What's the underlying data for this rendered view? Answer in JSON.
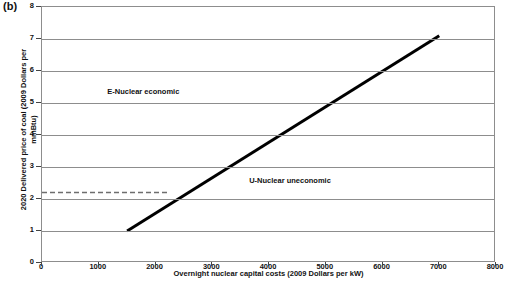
{
  "panel": {
    "label": "(b)"
  },
  "chart_data": {
    "type": "line",
    "title": "",
    "subtitle": "",
    "xlabel": "Overnight nuclear capital costs (2009 Dollars per kW)",
    "ylabel": "2020 Delivered price of coal (2009 Dollars per mmBtu)",
    "xlim": [
      0,
      8000
    ],
    "ylim": [
      0,
      8
    ],
    "xticks": [
      0,
      1000,
      2000,
      3000,
      4000,
      5000,
      6000,
      7000,
      8000
    ],
    "xtick_labels": [
      "0",
      "1000",
      "2000",
      "3000",
      "4000",
      "5000",
      "6000",
      "7000",
      "8000"
    ],
    "yticks": [
      0,
      1,
      2,
      3,
      4,
      5,
      6,
      7,
      8
    ],
    "ytick_labels": [
      "0",
      "1",
      "2",
      "3",
      "4",
      "5",
      "6",
      "7",
      "8"
    ],
    "grid": "horizontal",
    "legend": "none",
    "series": [
      {
        "name": "Breakeven line",
        "style": "solid",
        "color": "#000000",
        "width": 3,
        "x": [
          1500,
          7000
        ],
        "y": [
          1.0,
          7.1
        ]
      },
      {
        "name": "Reference coal price",
        "style": "dashed",
        "color": "#6e6e6e",
        "width": 1.5,
        "x": [
          0,
          2250
        ],
        "y": [
          2.2,
          2.2
        ]
      }
    ],
    "annotations": [
      {
        "text": "E-Nuclear economic",
        "x": 1150,
        "y": 5.35
      },
      {
        "text": "U-Nuclear uneconomic",
        "x": 3650,
        "y": 2.55
      }
    ]
  }
}
